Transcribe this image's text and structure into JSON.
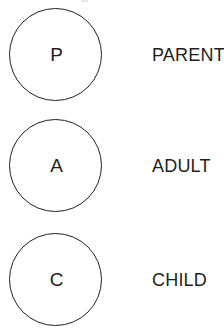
{
  "diagram": {
    "background_color": "#ffffff",
    "stroke_color": "#231f20",
    "text_color": "#231f20",
    "items": [
      {
        "initial": "P",
        "label": "PARENT"
      },
      {
        "initial": "A",
        "label": "ADULT"
      },
      {
        "initial": "C",
        "label": "CHILD"
      }
    ]
  }
}
